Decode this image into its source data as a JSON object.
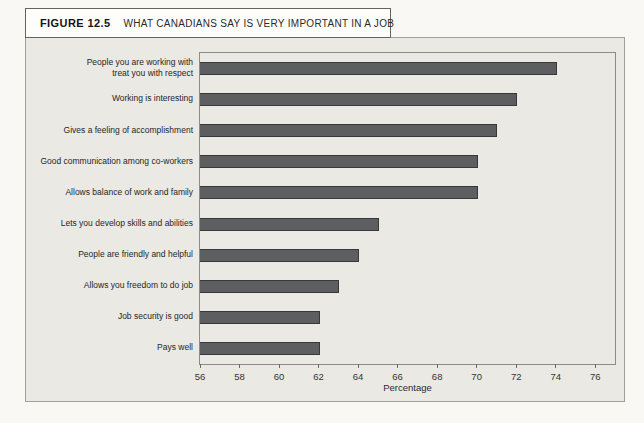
{
  "figure": {
    "label": "FIGURE 12.5",
    "title": "WHAT CANADIANS SAY IS VERY IMPORTANT IN A JOB"
  },
  "chart_data": {
    "type": "bar",
    "orientation": "horizontal",
    "title": "What Canadians Say Is Very Important in a Job",
    "categories": [
      "People you are working with\ntreat you with respect",
      "Working is interesting",
      "Gives a feeling of accomplishment",
      "Good communication among co-workers",
      "Allows balance of work and family",
      "Lets you develop skills and abilities",
      "People are friendly and helpful",
      "Allows you freedom to do job",
      "Job security is good",
      "Pays well"
    ],
    "values": [
      74,
      72,
      71,
      70,
      70,
      65,
      64,
      63,
      62,
      62
    ],
    "xlabel": "Percentage",
    "ylabel": "",
    "xlim": [
      56,
      77
    ],
    "xticks": [
      56,
      58,
      60,
      62,
      64,
      66,
      68,
      70,
      72,
      74,
      76
    ],
    "grid": false,
    "legend": "none",
    "bar_color": "#5d5e60",
    "bar_border_color": "#37383a",
    "panel_color": "#eae9e4"
  }
}
